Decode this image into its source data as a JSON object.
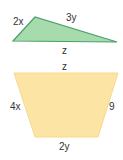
{
  "figures": [
    {
      "type": "triangle",
      "fill": "#9fd7a8",
      "stroke": "#3d9a5a",
      "vertices": [
        [
          13,
          41
        ],
        [
          35,
          17
        ],
        [
          117,
          42
        ]
      ],
      "labels": {
        "left_side": "2x",
        "top_side": "3y",
        "bottom_side": "z"
      }
    },
    {
      "type": "trapezoid",
      "fill": "#fbe3a0",
      "stroke": "#f5d480",
      "vertices": [
        [
          14,
          73
        ],
        [
          118,
          73
        ],
        [
          98,
          137
        ],
        [
          35,
          137
        ]
      ],
      "labels": {
        "top_side": "z",
        "left_side": "4x",
        "right_side": "9",
        "bottom_side": "2y"
      }
    }
  ]
}
